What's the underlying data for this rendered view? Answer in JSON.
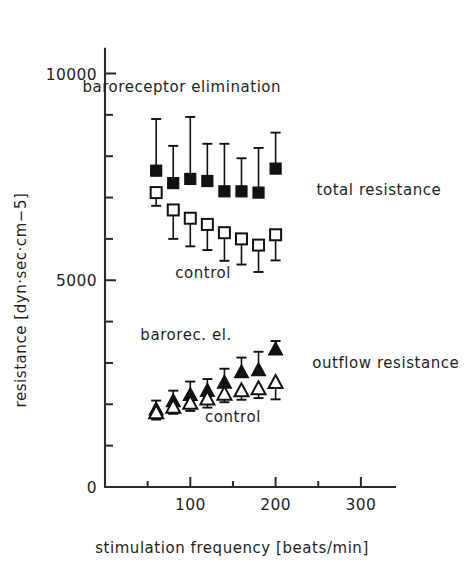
{
  "figure": {
    "name": "resistance-vs-stimulation-frequency",
    "background": "#ffffff",
    "ink": "#1a1a1a"
  },
  "chart_data": {
    "type": "scatter",
    "title": "",
    "subtitle": "",
    "xlabel": "stimulation frequency  [beats/min]",
    "ylabel": "resistance  [dyn·sec·cm−5]",
    "xlim": [
      0,
      340
    ],
    "ylim": [
      0,
      10600
    ],
    "grid": false,
    "legend": "inline-annotations",
    "x_ticks": [
      0,
      100,
      200,
      300
    ],
    "x_tick_labels": [
      "0",
      "100",
      "200",
      "300"
    ],
    "x_minor_ticks": [
      50,
      150,
      250
    ],
    "y_ticks": [
      0,
      5000,
      10000
    ],
    "y_tick_labels": [
      "0",
      "5000",
      "10000"
    ],
    "y_minor_ticks": [
      1000,
      2000,
      3000,
      4000,
      6000,
      7000,
      8000,
      9000
    ],
    "x": [
      60,
      80,
      100,
      120,
      140,
      160,
      180,
      200
    ],
    "series": [
      {
        "name": "total resistance — baroreceptor elimination",
        "short_name": "baroreceptor elimination",
        "marker": "filled-square",
        "color": "#111111",
        "error_direction": "up",
        "values": [
          7650,
          7350,
          7450,
          7400,
          7150,
          7150,
          7120,
          7700
        ],
        "errors": [
          1250,
          900,
          1500,
          900,
          1150,
          800,
          1080,
          870
        ]
      },
      {
        "name": "total resistance — control",
        "short_name": "control",
        "marker": "open-square",
        "color": "#111111",
        "error_direction": "down",
        "values": [
          7120,
          6700,
          6500,
          6350,
          6150,
          6000,
          5850,
          6100
        ],
        "errors": [
          320,
          700,
          680,
          620,
          680,
          620,
          650,
          620
        ]
      },
      {
        "name": "outflow resistance — baroreceptor elimination",
        "short_name": "barorec. el.",
        "marker": "filled-triangle",
        "color": "#111111",
        "error_direction": "up",
        "values": [
          1900,
          2100,
          2250,
          2350,
          2550,
          2800,
          2850,
          3350
        ],
        "errors": [
          190,
          230,
          300,
          260,
          310,
          330,
          420,
          180
        ]
      },
      {
        "name": "outflow resistance — control",
        "short_name": "control",
        "marker": "open-triangle",
        "color": "#111111",
        "error_direction": "down",
        "values": [
          1820,
          1950,
          2050,
          2150,
          2270,
          2350,
          2400,
          2550
        ],
        "errors": [
          190,
          180,
          210,
          230,
          220,
          240,
          250,
          430
        ]
      }
    ],
    "annotations": [
      {
        "id": "baroreceptor-elimination",
        "text": "baroreceptor elimination",
        "x": 90,
        "y": 9550,
        "anchor": "middle"
      },
      {
        "id": "total-resistance",
        "text": "total resistance",
        "x": 248,
        "y": 7050,
        "anchor": "start"
      },
      {
        "id": "control-total",
        "text": "control",
        "x": 115,
        "y": 5050,
        "anchor": "middle"
      },
      {
        "id": "barorec-el",
        "text": "barorec. el.",
        "x": 95,
        "y": 3550,
        "anchor": "middle"
      },
      {
        "id": "outflow-resistance",
        "text": "outflow resistance",
        "x": 243,
        "y": 2880,
        "anchor": "start"
      },
      {
        "id": "control-outflow",
        "text": "control",
        "x": 150,
        "y": 1580,
        "anchor": "middle"
      }
    ]
  }
}
